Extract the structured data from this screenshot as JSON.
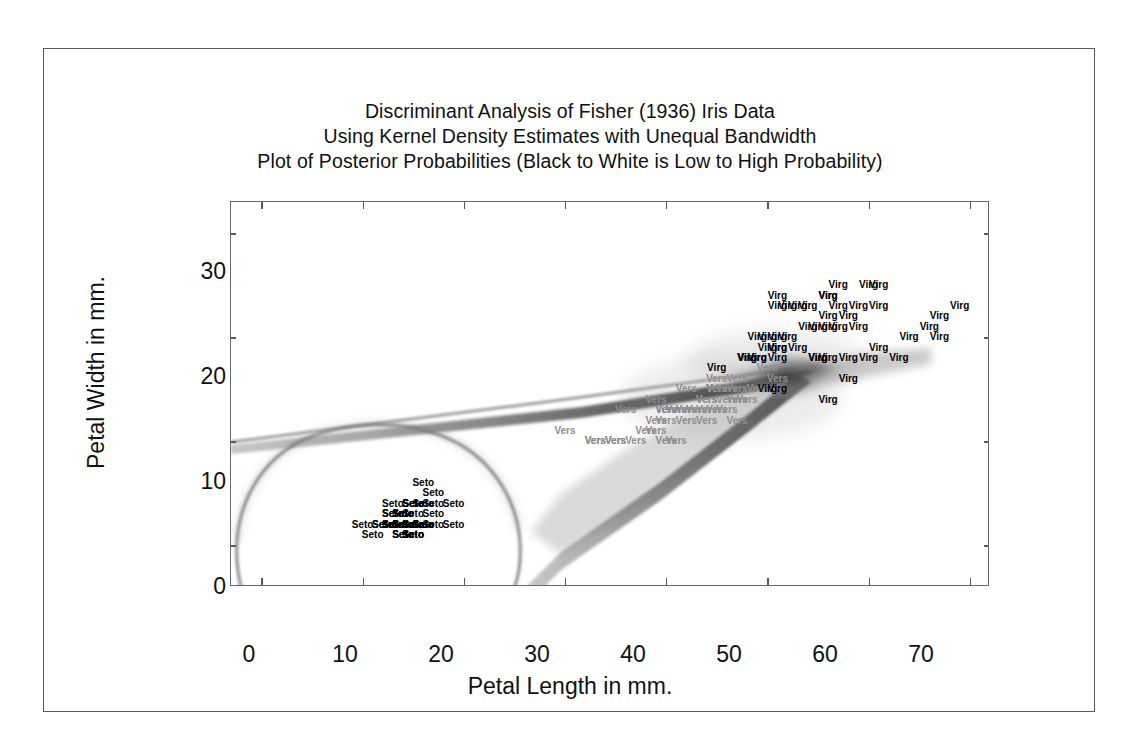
{
  "figure": {
    "title_lines": [
      "Discriminant Analysis of Fisher (1936) Iris Data",
      "Using Kernel Density Estimates with Unequal Bandwidth",
      "Plot of Posterior Probabilities (Black to White is Low to High Probability)"
    ]
  },
  "chart_data": {
    "type": "scatter",
    "title": "Discriminant Analysis of Fisher (1936) Iris Data\nUsing Kernel Density Estimates with Unequal Bandwidth\nPlot of Posterior Probabilities (Black to White is Low to High Probability)",
    "xlabel": "Petal Length in mm.",
    "ylabel": "Petal Width in mm.",
    "xlim": [
      -3,
      72
    ],
    "ylim": [
      -4,
      33
    ],
    "xticks": [
      0,
      10,
      20,
      30,
      40,
      50,
      60,
      70
    ],
    "yticks": [
      0,
      10,
      20,
      30
    ],
    "xtick_labels": [
      "0",
      "10",
      "20",
      "30",
      "40",
      "50",
      "60",
      "70"
    ],
    "ytick_labels": [
      "0",
      "10",
      "20",
      "30"
    ],
    "grid": false,
    "legend": "none",
    "ticks_all_sides": true,
    "background_layer": "kernel density posterior probability shading, black = low probability, white = high probability",
    "series": [
      {
        "name": "Seto",
        "label": "Seto",
        "color": "#000000",
        "marker_text": "Seto",
        "points": [
          [
            14,
            2
          ],
          [
            15,
            1
          ],
          [
            14,
            2
          ],
          [
            13,
            2
          ],
          [
            14,
            2
          ],
          [
            17,
            4
          ],
          [
            14,
            3
          ],
          [
            15,
            2
          ],
          [
            14,
            2
          ],
          [
            15,
            1
          ],
          [
            15,
            2
          ],
          [
            16,
            2
          ],
          [
            14,
            1
          ],
          [
            11,
            1
          ],
          [
            12,
            2
          ],
          [
            15,
            4
          ],
          [
            13,
            4
          ],
          [
            14,
            3
          ],
          [
            17,
            3
          ],
          [
            15,
            3
          ],
          [
            17,
            2
          ],
          [
            15,
            4
          ],
          [
            10,
            2
          ],
          [
            17,
            5
          ],
          [
            19,
            2
          ],
          [
            16,
            2
          ],
          [
            16,
            4
          ],
          [
            15,
            2
          ],
          [
            14,
            2
          ],
          [
            16,
            2
          ],
          [
            16,
            2
          ],
          [
            15,
            4
          ],
          [
            15,
            1
          ],
          [
            14,
            2
          ],
          [
            15,
            2
          ],
          [
            12,
            2
          ],
          [
            13,
            2
          ],
          [
            14,
            1
          ],
          [
            13,
            2
          ],
          [
            15,
            2
          ],
          [
            13,
            3
          ],
          [
            13,
            3
          ],
          [
            13,
            2
          ],
          [
            16,
            6
          ],
          [
            19,
            4
          ],
          [
            14,
            3
          ],
          [
            16,
            2
          ],
          [
            14,
            2
          ],
          [
            15,
            2
          ],
          [
            14,
            2
          ]
        ]
      },
      {
        "name": "Vers",
        "label": "Vers",
        "color": "#8d8d8d",
        "marker_text": "Vers",
        "points": [
          [
            47,
            14
          ],
          [
            45,
            15
          ],
          [
            49,
            15
          ],
          [
            40,
            13
          ],
          [
            46,
            15
          ],
          [
            45,
            13
          ],
          [
            47,
            16
          ],
          [
            33,
            10
          ],
          [
            46,
            13
          ],
          [
            39,
            14
          ],
          [
            35,
            10
          ],
          [
            42,
            15
          ],
          [
            40,
            10
          ],
          [
            47,
            15
          ],
          [
            36,
            13
          ],
          [
            44,
            14
          ],
          [
            45,
            15
          ],
          [
            41,
            10
          ],
          [
            45,
            15
          ],
          [
            39,
            11
          ],
          [
            48,
            18
          ],
          [
            40,
            13
          ],
          [
            49,
            15
          ],
          [
            47,
            12
          ],
          [
            43,
            13
          ],
          [
            44,
            14
          ],
          [
            48,
            14
          ],
          [
            50,
            17
          ],
          [
            45,
            15
          ],
          [
            35,
            10
          ],
          [
            38,
            11
          ],
          [
            37,
            10
          ],
          [
            39,
            12
          ],
          [
            51,
            16
          ],
          [
            45,
            15
          ],
          [
            45,
            16
          ],
          [
            47,
            15
          ],
          [
            44,
            13
          ],
          [
            41,
            13
          ],
          [
            40,
            13
          ],
          [
            44,
            12
          ],
          [
            46,
            14
          ],
          [
            40,
            12
          ],
          [
            33,
            10
          ],
          [
            42,
            13
          ],
          [
            42,
            12
          ],
          [
            42,
            13
          ],
          [
            43,
            13
          ],
          [
            30,
            11
          ],
          [
            41,
            13
          ]
        ]
      },
      {
        "name": "Virg",
        "label": "Virg",
        "color": "#000000",
        "marker_text": "Virg",
        "points": [
          [
            60,
            25
          ],
          [
            51,
            19
          ],
          [
            59,
            21
          ],
          [
            56,
            18
          ],
          [
            58,
            22
          ],
          [
            66,
            21
          ],
          [
            45,
            17
          ],
          [
            63,
            18
          ],
          [
            58,
            18
          ],
          [
            61,
            25
          ],
          [
            51,
            20
          ],
          [
            53,
            19
          ],
          [
            55,
            21
          ],
          [
            50,
            20
          ],
          [
            51,
            24
          ],
          [
            53,
            23
          ],
          [
            55,
            18
          ],
          [
            67,
            22
          ],
          [
            69,
            23
          ],
          [
            50,
            15
          ],
          [
            57,
            23
          ],
          [
            49,
            20
          ],
          [
            67,
            20
          ],
          [
            49,
            18
          ],
          [
            57,
            21
          ],
          [
            60,
            18
          ],
          [
            48,
            18
          ],
          [
            49,
            18
          ],
          [
            56,
            21
          ],
          [
            58,
            16
          ],
          [
            61,
            19
          ],
          [
            64,
            20
          ],
          [
            56,
            22
          ],
          [
            51,
            15
          ],
          [
            56,
            14
          ],
          [
            61,
            23
          ],
          [
            56,
            24
          ],
          [
            55,
            18
          ],
          [
            48,
            18
          ],
          [
            54,
            21
          ],
          [
            56,
            24
          ],
          [
            51,
            23
          ],
          [
            51,
            19
          ],
          [
            59,
            23
          ],
          [
            57,
            25
          ],
          [
            52,
            23
          ],
          [
            50,
            19
          ],
          [
            52,
            20
          ],
          [
            54,
            23
          ],
          [
            51,
            18
          ]
        ]
      }
    ],
    "decision_boundaries": [
      "closed contour enclosing the Seto group in the lower-left region",
      "narrow dark band running from the left edge near 7 mm width diagonally up to the right toward 53 mm length",
      "second dark band rising from the lower region near 23 mm length toward the convergence point"
    ]
  },
  "axes": {
    "x": {
      "label": "Petal Length in mm.",
      "ticks": [
        {
          "value": 0,
          "label": "0"
        },
        {
          "value": 10,
          "label": "10"
        },
        {
          "value": 20,
          "label": "20"
        },
        {
          "value": 30,
          "label": "30"
        },
        {
          "value": 40,
          "label": "40"
        },
        {
          "value": 50,
          "label": "50"
        },
        {
          "value": 60,
          "label": "60"
        },
        {
          "value": 70,
          "label": "70"
        }
      ]
    },
    "y": {
      "label": "Petal Width in mm.",
      "ticks": [
        {
          "value": 0,
          "label": "0"
        },
        {
          "value": 10,
          "label": "10"
        },
        {
          "value": 20,
          "label": "20"
        },
        {
          "value": 30,
          "label": "30"
        }
      ]
    }
  },
  "colors": {
    "frame": "#5a5a5a",
    "text": "#111111",
    "seto": "#000000",
    "vers": "#8d8d8d",
    "virg": "#000000"
  }
}
